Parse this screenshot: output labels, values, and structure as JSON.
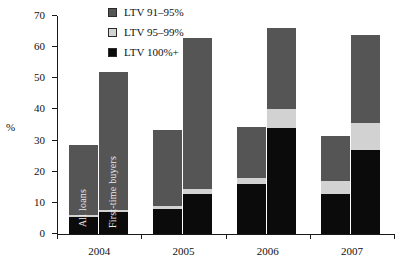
{
  "chart_data": {
    "type": "bar",
    "title": "",
    "subtitle": "",
    "xlabel": "",
    "ylabel": "%",
    "ylim": [
      0,
      70
    ],
    "yticks": [
      0,
      10,
      20,
      30,
      40,
      50,
      60,
      70
    ],
    "grid": false,
    "stacked": true,
    "legend_position": "top-left-inside",
    "categories": [
      "2004",
      "2005",
      "2006",
      "2007"
    ],
    "group_labels": [
      "All loans",
      "First-time buyers"
    ],
    "series": [
      {
        "name": "LTV 100%+",
        "color": "#0b0b0b",
        "values": {
          "All loans": [
            5.5,
            8.0,
            16.0,
            13.0
          ],
          "First-time buyers": [
            7.0,
            13.0,
            34.0,
            27.0
          ]
        }
      },
      {
        "name": "LTV 95–99%",
        "color": "#d2d2d2",
        "values": {
          "All loans": [
            0.7,
            1.0,
            2.0,
            4.0
          ],
          "First-time buyers": [
            0.8,
            1.5,
            6.0,
            8.5
          ]
        }
      },
      {
        "name": "LTV 91–95%",
        "color": "#555555",
        "values": {
          "All loans": [
            22.3,
            24.5,
            16.5,
            14.5
          ],
          "First-time buyers": [
            44.2,
            48.5,
            26.0,
            28.5
          ]
        }
      }
    ],
    "totals": {
      "All loans": [
        28.5,
        33.5,
        34.5,
        31.5
      ],
      "First-time buyers": [
        52.0,
        63.0,
        66.0,
        64.0
      ]
    },
    "annotations": [
      {
        "text": "All loans",
        "bar": "2004 All loans",
        "orientation": "vertical"
      },
      {
        "text": "First-time buyers",
        "bar": "2004 First-time buyers",
        "orientation": "vertical"
      }
    ]
  },
  "legend": {
    "items": [
      {
        "label": "LTV 91–95%",
        "swatch": "dark-gray-swatch"
      },
      {
        "label": "LTV 95–99%",
        "swatch": "light-gray-swatch"
      },
      {
        "label": "LTV 100%+",
        "swatch": "black-swatch"
      }
    ]
  },
  "axes": {
    "y_label": "%",
    "y_ticks": [
      "0",
      "10",
      "20",
      "30",
      "40",
      "50",
      "60",
      "70"
    ],
    "x_ticks": [
      "2004",
      "2005",
      "2006",
      "2007"
    ]
  }
}
